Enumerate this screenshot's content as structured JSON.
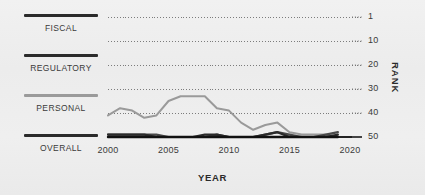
{
  "legend": {
    "items": [
      {
        "label": "FISCAL",
        "color": "#2b2b2b",
        "key": "fiscal"
      },
      {
        "label": "REGULATORY",
        "color": "#2b2b2b",
        "key": "regulatory"
      },
      {
        "label": "PERSONAL",
        "color": "#9a9a9a",
        "key": "personal"
      },
      {
        "label": "OVERALL",
        "color": "#1a1a1a",
        "key": "overall"
      }
    ]
  },
  "chart_data": {
    "type": "line",
    "title": "",
    "xlabel": "YEAR",
    "ylabel": "RANK",
    "x": [
      2000,
      2001,
      2002,
      2003,
      2004,
      2005,
      2006,
      2007,
      2008,
      2009,
      2010,
      2011,
      2012,
      2013,
      2014,
      2015,
      2016,
      2017,
      2018,
      2019
    ],
    "xticks": [
      2000,
      2005,
      2010,
      2015,
      2020
    ],
    "yticks": [
      1,
      10,
      20,
      30,
      40,
      50
    ],
    "xlim": [
      2000,
      2020
    ],
    "ylim": [
      1,
      50
    ],
    "y_inverted": true,
    "grid": "horizontal-dotted",
    "legend_position": "left-outside",
    "series": [
      {
        "name": "PERSONAL",
        "color": "#9a9a9a",
        "values": [
          41,
          38,
          39,
          42,
          41,
          35,
          33,
          33,
          33,
          38,
          39,
          44,
          47,
          45,
          44,
          48,
          49,
          49,
          49,
          50
        ]
      },
      {
        "name": "REGULATORY",
        "color": "#4a4a4a",
        "values": [
          49,
          49,
          49,
          49,
          49,
          50,
          50,
          50,
          50,
          49,
          50,
          50,
          50,
          49,
          48,
          49,
          50,
          50,
          49,
          48
        ]
      },
      {
        "name": "FISCAL",
        "color": "#2b2b2b",
        "values": [
          49,
          49,
          49,
          49,
          50,
          50,
          50,
          50,
          49,
          49,
          50,
          50,
          50,
          49,
          48,
          50,
          50,
          50,
          50,
          49
        ]
      },
      {
        "name": "OVERALL",
        "color": "#111111",
        "values": [
          50,
          50,
          50,
          50,
          50,
          50,
          50,
          50,
          50,
          50,
          50,
          50,
          50,
          50,
          50,
          50,
          50,
          50,
          50,
          50
        ]
      }
    ]
  }
}
